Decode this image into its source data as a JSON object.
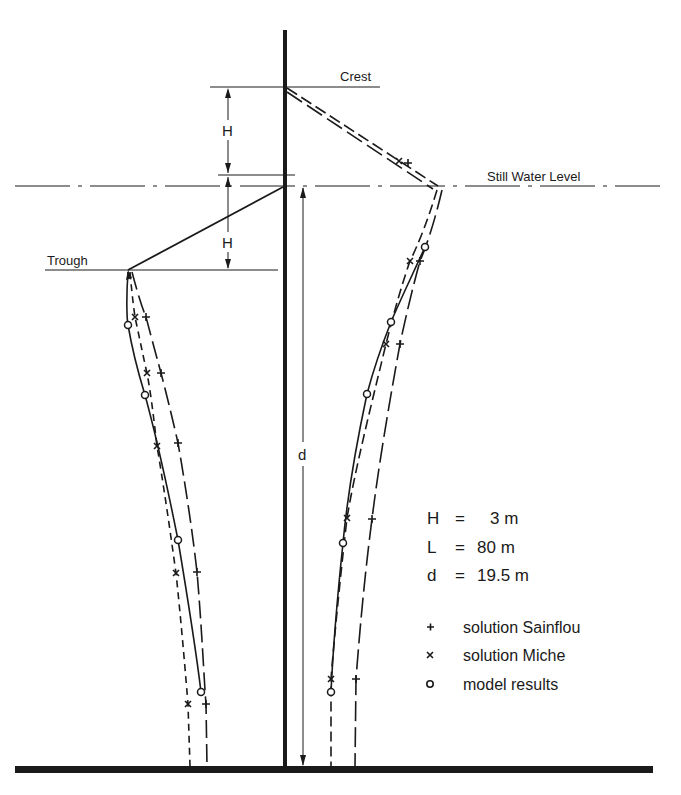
{
  "figure": {
    "colors": {
      "ink": "#1a1a1a",
      "background": "#ffffff"
    }
  },
  "labels": {
    "crest": "Crest",
    "still_water_level": "Still Water Level",
    "trough": "Trough",
    "dim_H_upper": "H",
    "dim_H_lower": "H",
    "dim_d": "d"
  },
  "parameters": [
    {
      "symbol": "H",
      "eq": "=",
      "value": "3 m"
    },
    {
      "symbol": "L",
      "eq": "=",
      "value": "80 m"
    },
    {
      "symbol": "d",
      "eq": "=",
      "value": "19.5 m"
    }
  ],
  "legend": [
    {
      "marker": "+",
      "icon": "plus-marker",
      "label": "solution Sainflou"
    },
    {
      "marker": "x",
      "icon": "cross-marker",
      "label": "solution Miche"
    },
    {
      "marker": "o",
      "icon": "circle-marker",
      "label": "model results"
    }
  ]
}
